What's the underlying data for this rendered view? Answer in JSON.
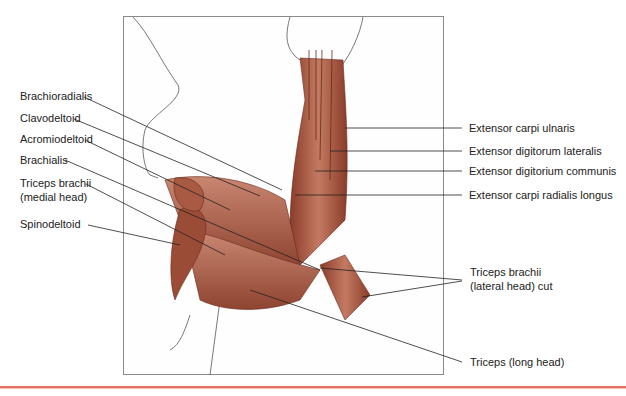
{
  "figure": {
    "left_labels": [
      {
        "text": "Brachioradialis"
      },
      {
        "text": "Clavodeltoid"
      },
      {
        "text": "Acromiodeltoid"
      },
      {
        "text": "Brachialis"
      },
      {
        "text": "Triceps brachii"
      },
      {
        "text": "(medial head)"
      },
      {
        "text": "Spinodeltoid"
      }
    ],
    "right_labels": [
      {
        "text": "Extensor carpi ulnaris"
      },
      {
        "text": "Extensor digitorum lateralis"
      },
      {
        "text": "Extensor digitorium communis"
      },
      {
        "text": "Extensor carpi radialis longus"
      },
      {
        "text": "Triceps brachii"
      },
      {
        "text": "(lateral head) cut"
      },
      {
        "text": "Triceps (long head)"
      }
    ],
    "colors": {
      "muscle": "#b0604a",
      "muscle_dark": "#7a3526",
      "leader": "#222222",
      "rule": "#e0706a"
    }
  }
}
